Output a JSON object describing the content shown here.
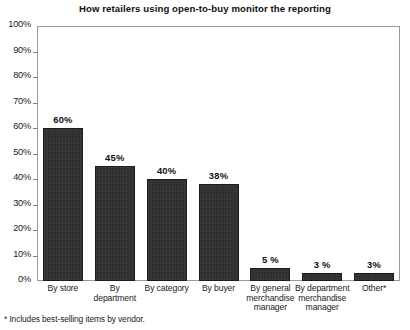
{
  "chart_data": {
    "type": "bar",
    "title": "How retailers using open-to-buy monitor the reporting",
    "xlabel": "",
    "ylabel": "",
    "ylim": [
      0,
      100
    ],
    "grid": false,
    "legend": null,
    "categories": [
      "By store",
      "By department",
      "By category",
      "By buyer",
      "By general merchandise manager",
      "By department merchandise manager",
      "Other*"
    ],
    "category_lines": [
      [
        "By store"
      ],
      [
        "By",
        "department"
      ],
      [
        "By category"
      ],
      [
        "By buyer"
      ],
      [
        "By general",
        "merchandise",
        "manager"
      ],
      [
        "By department",
        "merchandise",
        "manager"
      ],
      [
        "Other*"
      ]
    ],
    "values": [
      60,
      45,
      40,
      38,
      5,
      3,
      3
    ],
    "value_labels": [
      "60%",
      "45%",
      "40%",
      "38%",
      "5 %",
      "3 %",
      "3%"
    ],
    "ytick_values": [
      100,
      90,
      80,
      70,
      60,
      50,
      40,
      30,
      20,
      10,
      0
    ],
    "ytick_labels": [
      "100%",
      "90%",
      "80%",
      "70%",
      "60%",
      "50%",
      "40%",
      "30%",
      "20%",
      "10%",
      "0%"
    ],
    "bar_color": "#2c2c2c",
    "annotation": "* Includes best-selling items by vendor."
  },
  "footnote": "* Includes best-selling items by vendor."
}
